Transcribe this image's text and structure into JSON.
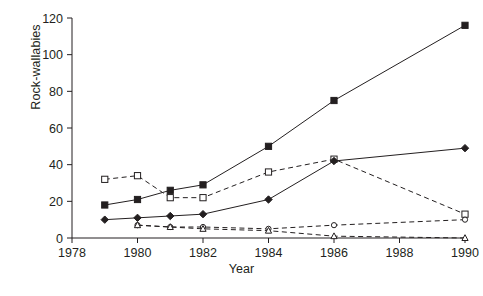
{
  "figure": {
    "ylabel": "Rock-wallabies",
    "xlabel": "Year",
    "caption": ""
  },
  "chart_data": {
    "type": "line",
    "title": "",
    "xlabel": "Year",
    "ylabel": "Rock-wallabies",
    "xlim": [
      1978,
      1990
    ],
    "ylim": [
      0,
      120
    ],
    "xticks": [
      1978,
      1980,
      1982,
      1984,
      1986,
      1988,
      1990
    ],
    "yticks": [
      0,
      20,
      40,
      60,
      80,
      100,
      120
    ],
    "grid": false,
    "legend": "none",
    "x": [
      1979,
      1980,
      1981,
      1982,
      1984,
      1986,
      1990
    ],
    "series": [
      {
        "name": "filled-square-solid",
        "marker": "filled-square",
        "line": "solid",
        "values": [
          18,
          21,
          26,
          29,
          50,
          75,
          116
        ]
      },
      {
        "name": "open-square-dashed",
        "marker": "open-square",
        "line": "dashed",
        "values": [
          32,
          34,
          22,
          22,
          36,
          43,
          13
        ]
      },
      {
        "name": "filled-diamond-solid",
        "marker": "filled-diamond",
        "line": "solid",
        "values": [
          10,
          11,
          12,
          13,
          21,
          42,
          49
        ]
      },
      {
        "name": "open-circle-dashed",
        "marker": "open-circle",
        "line": "dashed",
        "values": [
          null,
          7,
          6,
          6,
          5,
          7,
          10
        ]
      },
      {
        "name": "open-triangle-dashed",
        "marker": "open-triangle",
        "line": "dashed",
        "values": [
          null,
          7,
          6,
          5,
          4,
          1,
          0
        ]
      }
    ]
  }
}
